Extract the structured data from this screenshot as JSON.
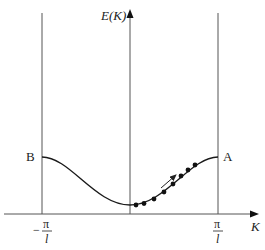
{
  "diagram": {
    "y_axis_label": "E(K)",
    "x_axis_label": "K",
    "point_left_label": "B",
    "point_right_label": "A",
    "left_tick": {
      "sign": "−",
      "numerator": "π",
      "denominator": "l"
    },
    "right_tick": {
      "numerator": "π",
      "denominator": "l"
    },
    "curve": "E(K) cosine-like band: maximum at K=±π/l, minimum at K=0",
    "dots_count": 8,
    "arrow": "electron motion along band toward A",
    "colors": {
      "line": "#333333",
      "curve": "#1a1a1a",
      "dots": "#111111"
    }
  }
}
